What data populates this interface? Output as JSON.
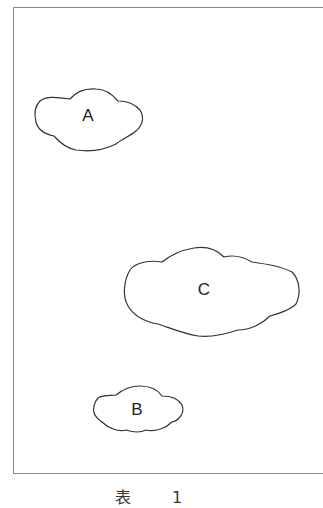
{
  "figure": {
    "clouds": [
      {
        "id": "A",
        "label": "A",
        "label_x": 88,
        "label_y": 116
      },
      {
        "id": "C",
        "label": "C",
        "label_x": 204,
        "label_y": 290
      },
      {
        "id": "B",
        "label": "B",
        "label_x": 137,
        "label_y": 410
      }
    ],
    "caption": "表 1",
    "line_color": "#333333",
    "frame_color": "#8a8a8a"
  }
}
